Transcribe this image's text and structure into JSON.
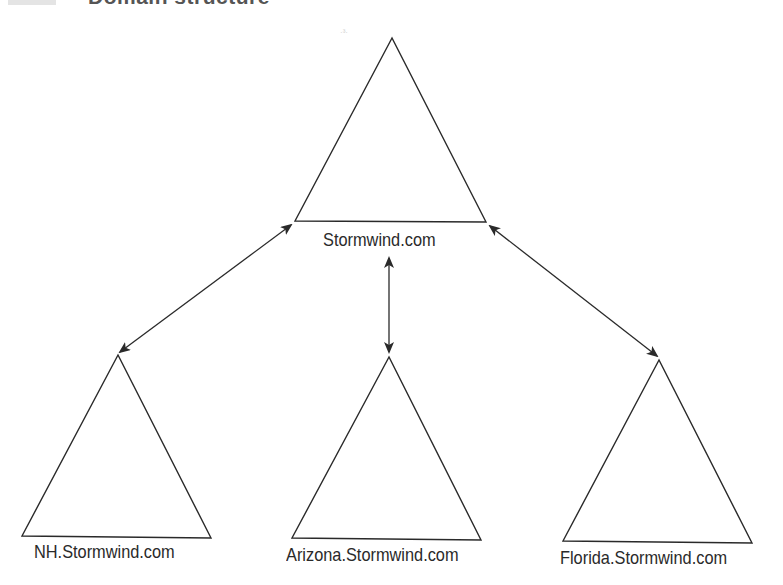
{
  "caption": {
    "figure_label": "",
    "title": "Domain structure"
  },
  "nodes": {
    "root": {
      "label": "Stormwind.com"
    },
    "children": [
      {
        "label": "NH.Stormwind.com"
      },
      {
        "label": "Arizona.Stormwind.com"
      },
      {
        "label": "Florida.Stormwind.com"
      }
    ]
  },
  "edges": [
    {
      "from": "Stormwind.com",
      "to": "NH.Stormwind.com",
      "type": "bidirectional"
    },
    {
      "from": "Stormwind.com",
      "to": "Arizona.Stormwind.com",
      "type": "bidirectional"
    },
    {
      "from": "Stormwind.com",
      "to": "Florida.Stormwind.com",
      "type": "bidirectional"
    }
  ],
  "colors": {
    "stroke": "#2a2a2a",
    "background": "#ffffff"
  },
  "artifact": "·³·"
}
